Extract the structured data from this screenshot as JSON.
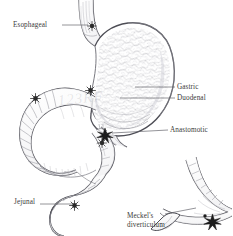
{
  "figure": {
    "background_color": "#ffffff",
    "ink_color": "#3a3a3a",
    "style": "pen-and-ink medical line illustration"
  },
  "labels": {
    "esophageal": "Esophageal",
    "gastric": "Gastric",
    "duodenal": "Duodenal",
    "anastomotic": "Anastomotic",
    "jejunal": "Jejunal",
    "meckels_line1": "Meckel's",
    "meckels_line2": "diverticulum"
  },
  "watermark": {
    "text": "123RF",
    "color": "#6e6e78"
  },
  "structures": [
    {
      "name": "esophagus",
      "label": "Esophageal"
    },
    {
      "name": "stomach",
      "label": "Gastric"
    },
    {
      "name": "duodenum",
      "label": "Duodenal"
    },
    {
      "name": "anastomosis",
      "label": "Anastomotic"
    },
    {
      "name": "jejunum",
      "label": "Jejunal"
    },
    {
      "name": "meckels-diverticulum-inset",
      "label": "Meckel's diverticulum"
    }
  ],
  "ulcer_markers": [
    {
      "site": "esophageal",
      "x": 92,
      "y": 26
    },
    {
      "site": "gastric",
      "x": 90,
      "y": 90
    },
    {
      "site": "duodenal",
      "x": 35,
      "y": 98
    },
    {
      "site": "anastomotic",
      "x": 105,
      "y": 136
    },
    {
      "site": "jejunal",
      "x": 74,
      "y": 205
    },
    {
      "site": "meckels",
      "x": 212,
      "y": 222
    }
  ]
}
